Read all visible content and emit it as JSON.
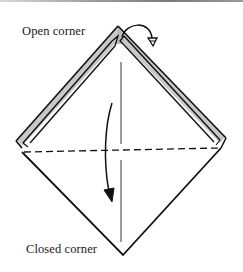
{
  "diagram": {
    "type": "origami-fold-step",
    "labels": {
      "open_corner": "Open corner",
      "closed_corner": "Closed corner"
    },
    "elements": {
      "fold_line": "dashed horizontal valley fold line across the diamond",
      "center_crease": "vertical center crease",
      "top_flaps": "layered open flaps at top (shaded)",
      "arrow_top": "curved arrow with hollow arrowhead — fold/flip top corner behind",
      "arrow_left": "curved arrow with solid arrowhead — fold down along dashed line"
    },
    "colors": {
      "stroke": "#111111",
      "flap_fill": "#c8c8c8",
      "background": "#ffffff"
    }
  }
}
